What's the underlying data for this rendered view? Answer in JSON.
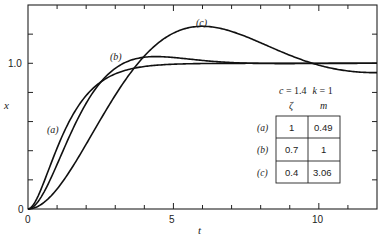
{
  "chart_data": {
    "type": "line",
    "title": "",
    "xlabel": "t",
    "ylabel": "x",
    "xlim": [
      0,
      12
    ],
    "ylim": [
      0,
      1.4
    ],
    "grid": false,
    "x_ticks": [
      0,
      5,
      10
    ],
    "x_minor_ticks": [
      1,
      2,
      3,
      4,
      6,
      7,
      8,
      9,
      11
    ],
    "y_ticks": [
      0,
      1.0
    ],
    "y_tick_labels": [
      "0",
      "1.0"
    ],
    "y_minor_ticks": [
      0.2,
      0.4,
      0.6,
      0.8,
      1.2
    ],
    "parameters": {
      "c": 1.4,
      "k": 1,
      "text": "c = 1.4   k = 1"
    },
    "table": {
      "headers": [
        "ζ",
        "m"
      ],
      "rows": [
        {
          "label": "(a)",
          "zeta": "1",
          "m": "0.49"
        },
        {
          "label": "(b)",
          "zeta": "0.7",
          "m": "1"
        },
        {
          "label": "(c)",
          "zeta": "0.4",
          "m": "3.06"
        }
      ]
    },
    "series": [
      {
        "name": "(a)",
        "zeta": 1,
        "m": 0.49,
        "x": [
          0,
          0.5,
          1,
          1.5,
          2,
          2.5,
          3,
          4,
          5,
          6,
          8,
          10,
          12
        ],
        "values": [
          0,
          0.16,
          0.42,
          0.63,
          0.78,
          0.87,
          0.93,
          0.98,
          0.99,
          1.0,
          1.0,
          1.0,
          1.0
        ]
      },
      {
        "name": "(b)",
        "zeta": 0.7,
        "m": 1,
        "x": [
          0,
          0.5,
          1,
          1.5,
          2,
          2.5,
          3,
          4,
          5,
          6,
          8,
          10,
          12
        ],
        "values": [
          0,
          0.11,
          0.33,
          0.55,
          0.74,
          0.87,
          0.96,
          1.04,
          1.04,
          1.02,
          1.0,
          1.0,
          1.0
        ]
      },
      {
        "name": "(c)",
        "zeta": 0.4,
        "m": 3.06,
        "x": [
          0,
          1,
          2,
          3,
          4,
          5,
          6,
          7,
          8,
          9,
          10,
          11,
          12
        ],
        "values": [
          0,
          0.15,
          0.49,
          0.84,
          1.08,
          1.21,
          1.24,
          1.19,
          1.1,
          1.01,
          0.94,
          0.91,
          0.91
        ]
      }
    ],
    "annotations": [
      {
        "text": "(a)",
        "t": 0.85,
        "x": 0.52
      },
      {
        "text": "(b)",
        "t": 3.1,
        "x": 1.05
      },
      {
        "text": "(c)",
        "t": 5.8,
        "x": 1.3
      }
    ]
  },
  "labels": {
    "x_axis": "t",
    "y_axis": "x",
    "x_tick_0": "0",
    "x_tick_5": "5",
    "x_tick_10": "10",
    "y_tick_0": "0",
    "y_tick_1": "1.0",
    "curve_a": "(a)",
    "curve_b": "(b)",
    "curve_c": "(c)",
    "param_c": "c",
    "param_c_val": " = 1.4",
    "param_k": "k",
    "param_k_val": " = 1",
    "table_header_zeta": "ζ",
    "table_header_m": "m",
    "row_a_label": "(a)",
    "row_a_zeta": "1",
    "row_a_m": "0.49",
    "row_b_label": "(b)",
    "row_b_zeta": "0.7",
    "row_b_m": "1",
    "row_c_label": "(c)",
    "row_c_zeta": "0.4",
    "row_c_m": "3.06"
  }
}
